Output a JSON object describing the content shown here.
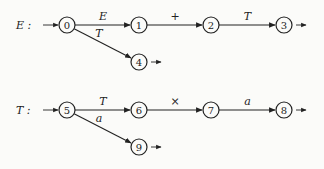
{
  "diagrams": [
    {
      "name": "E",
      "label": "E :",
      "nodes": [
        {
          "id": "0",
          "x": 67,
          "y": 25,
          "start": true
        },
        {
          "id": "1",
          "x": 139,
          "y": 25
        },
        {
          "id": "2",
          "x": 211,
          "y": 25
        },
        {
          "id": "3",
          "x": 284,
          "y": 25,
          "final": true
        },
        {
          "id": "4",
          "x": 139,
          "y": 62,
          "final": true
        }
      ],
      "edges": [
        {
          "from": "0",
          "to": "1",
          "label": "E",
          "italic": true
        },
        {
          "from": "1",
          "to": "2",
          "label": "+",
          "italic": false
        },
        {
          "from": "2",
          "to": "3",
          "label": "T",
          "italic": true
        },
        {
          "from": "0",
          "to": "4",
          "label": "T",
          "italic": true
        }
      ]
    },
    {
      "name": "T",
      "label": "T :",
      "nodes": [
        {
          "id": "5",
          "x": 67,
          "y": 110,
          "start": true
        },
        {
          "id": "6",
          "x": 139,
          "y": 110
        },
        {
          "id": "7",
          "x": 211,
          "y": 110
        },
        {
          "id": "8",
          "x": 284,
          "y": 110,
          "final": true
        },
        {
          "id": "9",
          "x": 139,
          "y": 147,
          "final": true
        }
      ],
      "edges": [
        {
          "from": "5",
          "to": "6",
          "label": "T",
          "italic": true
        },
        {
          "from": "6",
          "to": "7",
          "label": "×",
          "italic": false
        },
        {
          "from": "7",
          "to": "8",
          "label": "a",
          "italic": true
        },
        {
          "from": "5",
          "to": "9",
          "label": "a",
          "italic": true
        }
      ]
    }
  ]
}
